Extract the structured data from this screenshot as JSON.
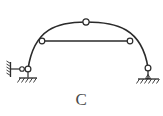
{
  "figure": {
    "caption": "C",
    "kind": "structural-mechanics-diagram",
    "stroke_color": "#2b2b2b",
    "caption_color": "#4a4a4a",
    "background_color": "#ffffff",
    "hinge_fill": "#ffffff"
  },
  "geometry": {
    "arch": {
      "label": "arch-rib",
      "left_springing": {
        "x": 28,
        "y": 69
      },
      "crown": {
        "x": 86,
        "y": 22
      },
      "right_springing": {
        "x": 148,
        "y": 68
      },
      "left_control": {
        "x": 34,
        "y": 28
      },
      "right_control": {
        "x": 140,
        "y": 27
      },
      "stroke_width": 1.6
    },
    "tie": {
      "label": "horizontal-tie-bar",
      "start": {
        "x": 42,
        "y": 41
      },
      "end": {
        "x": 130,
        "y": 41
      },
      "stroke_width": 1.4
    },
    "hinges": [
      {
        "name": "crown-hinge",
        "x": 86,
        "y": 22,
        "r": 3.1
      },
      {
        "name": "tie-left-hinge",
        "x": 42,
        "y": 41,
        "r": 2.8
      },
      {
        "name": "tie-right-hinge",
        "x": 130,
        "y": 41,
        "r": 2.8
      },
      {
        "name": "left-support-hinge",
        "x": 28,
        "y": 69,
        "r": 2.9
      },
      {
        "name": "left-wall-link-hinge",
        "x": 22,
        "y": 69,
        "r": 2.3
      },
      {
        "name": "right-support-hinge",
        "x": 148,
        "y": 68,
        "r": 2.9
      }
    ],
    "left_support": {
      "label": "left-pin-on-link-support",
      "wall": {
        "x": 10,
        "y_top": 62,
        "y_bottom": 78
      },
      "wall_hatch_count": 5,
      "link_horizontal": {
        "x1": 11,
        "x2": 22,
        "y": 69
      },
      "link_vertical": {
        "x": 28,
        "y1": 71,
        "y2": 78
      },
      "ground_line": {
        "x1": 18,
        "x2": 38,
        "y": 78
      },
      "ground_hatch_count": 5
    },
    "right_support": {
      "label": "right-pin-support",
      "stem": {
        "x": 148,
        "y1": 70,
        "y2": 79
      },
      "ground_line": {
        "x1": 137,
        "x2": 160,
        "y": 79
      },
      "ground_hatch_count": 6
    }
  }
}
